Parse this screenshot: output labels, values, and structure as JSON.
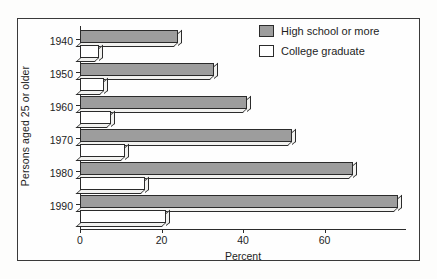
{
  "chart_data": {
    "type": "bar",
    "orientation": "horizontal",
    "title": "",
    "xlabel": "Percent",
    "ylabel": "Persons aged 25 or older",
    "categories": [
      "1940",
      "1950",
      "1960",
      "1970",
      "1980",
      "1990"
    ],
    "series": [
      {
        "name": "High school or more",
        "color": "#9d9d9d",
        "values": [
          24,
          33,
          41,
          52,
          67,
          78
        ]
      },
      {
        "name": "College graduate",
        "color": "#ffffff",
        "values": [
          4.6,
          6,
          7.7,
          11,
          16,
          21
        ]
      }
    ],
    "xlim": [
      0,
      80
    ],
    "xticks": [
      0,
      20,
      40,
      60
    ],
    "xtick_labels": [
      "0",
      "20",
      "40",
      "60"
    ],
    "grid": false,
    "legend_position": "top-right",
    "legend": [
      "High school or more",
      "College graduate"
    ]
  },
  "legend": {
    "items": [
      {
        "label": "High school or more",
        "swatch": "hs"
      },
      {
        "label": "College graduate",
        "swatch": "cg"
      }
    ]
  },
  "axes": {
    "x_title": "Percent",
    "y_title": "Persons aged 25 or older"
  }
}
